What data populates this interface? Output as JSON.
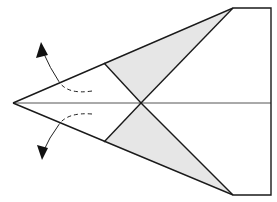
{
  "diagram": {
    "type": "paper-airplane-folding-step",
    "colors": {
      "line": "#1a1a1a",
      "shade": "#e6e6e6",
      "center": "#555555",
      "arrow": "#222222"
    },
    "parts": [
      "outline",
      "shaded-flaps",
      "center-crease",
      "inner-fold-lines",
      "unfold-arrows"
    ]
  }
}
